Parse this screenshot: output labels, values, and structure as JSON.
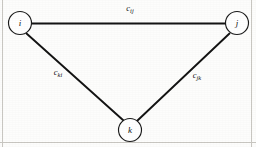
{
  "figure": {
    "type": "undirected-graph-diagram",
    "background_color": "#fdfdfc",
    "stroke_color": "#141414",
    "border_color": "#c9c7c2",
    "width": 256,
    "height": 147
  },
  "nodes": [
    {
      "id": "i",
      "label": "i",
      "cx": 20,
      "cy": 23,
      "r": 11.5
    },
    {
      "id": "j",
      "label": "j",
      "cx": 237,
      "cy": 23,
      "r": 11.5
    },
    {
      "id": "k",
      "label": "k",
      "cx": 130,
      "cy": 130,
      "r": 11.5
    }
  ],
  "edges": [
    {
      "id": "ij",
      "from": "i",
      "to": "j",
      "label_base": "c",
      "label_sub": "ij",
      "label_x": 130,
      "label_y": 9,
      "x1": 31.5,
      "y1": 23.5,
      "x2": 225.5,
      "y2": 23.5
    },
    {
      "id": "ki",
      "from": "k",
      "to": "i",
      "label_base": "c",
      "label_sub": "ki",
      "label_x": 58,
      "label_y": 73,
      "x1": 26.5,
      "y1": 33.5,
      "x2": 123.5,
      "y2": 120.5
    },
    {
      "id": "jk",
      "from": "j",
      "to": "k",
      "label_base": "c",
      "label_sub": "jk",
      "label_x": 197,
      "label_y": 76,
      "x1": 229.5,
      "y1": 33.5,
      "x2": 137.5,
      "y2": 120.5
    }
  ],
  "border": {
    "left_x": 2.5,
    "right_x": 251.5,
    "bottom_y": 142.5,
    "top_y": 0
  }
}
